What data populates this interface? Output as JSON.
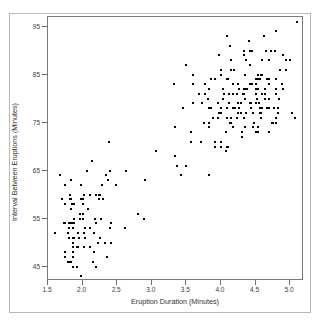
{
  "chart_data": {
    "type": "scatter",
    "title": "",
    "xlabel": "Eruption Duration (Minutes)",
    "ylabel": "Interval Between Eruptions (Minutes)",
    "xlim": [
      1.5,
      5.2
    ],
    "ylim": [
      42,
      97
    ],
    "xticks": [
      1.5,
      2.0,
      2.5,
      3.0,
      3.5,
      4.0,
      4.5,
      5.0
    ],
    "xticklabels": [
      "1.5",
      "2.0",
      "2.5",
      "3.0",
      "3.5",
      "4.0",
      "4.5",
      "5.0"
    ],
    "yticks": [
      95,
      85,
      75,
      65,
      55,
      45
    ],
    "yticklabels": [
      "95",
      "85",
      "75",
      "65",
      "55",
      "45"
    ],
    "grid": false,
    "legend": null,
    "marker": {
      "shape": "square",
      "size_px": 2,
      "color": "#000000"
    },
    "n_points": 272,
    "series": [
      {
        "name": "Old Faithful eruptions",
        "color": "#000000",
        "x": [
          3.6,
          1.8,
          3.333,
          2.283,
          4.533,
          2.883,
          4.7,
          3.6,
          1.95,
          4.35,
          1.833,
          3.917,
          4.2,
          1.75,
          4.7,
          2.167,
          1.75,
          4.8,
          1.6,
          4.25,
          1.8,
          1.75,
          3.45,
          3.067,
          4.533,
          3.6,
          1.967,
          4.083,
          3.85,
          4.433,
          4.3,
          4.467,
          3.367,
          4.033,
          3.833,
          2.017,
          1.867,
          4.833,
          1.833,
          4.783,
          4.35,
          1.883,
          4.567,
          1.75,
          4.533,
          3.317,
          3.833,
          2.1,
          4.633,
          2.0,
          4.8,
          4.716,
          1.833,
          4.833,
          1.733,
          4.883,
          3.717,
          1.667,
          4.567,
          4.317,
          2.233,
          4.5,
          1.75,
          4.8,
          1.817,
          4.4,
          4.167,
          4.7,
          2.067,
          4.7,
          4.033,
          1.967,
          4.5,
          4.0,
          1.983,
          5.067,
          2.017,
          4.567,
          3.883,
          3.6,
          4.133,
          4.333,
          4.1,
          2.633,
          4.067,
          4.933,
          3.95,
          4.517,
          2.167,
          4.0,
          2.2,
          4.333,
          1.867,
          4.817,
          1.833,
          4.3,
          4.667,
          3.75,
          1.867,
          4.9,
          2.483,
          4.367,
          2.1,
          4.5,
          4.05,
          1.867,
          4.7,
          1.783,
          4.85,
          3.683,
          4.733,
          2.3,
          4.9,
          4.417,
          1.7,
          4.633,
          2.317,
          4.6,
          1.817,
          4.417,
          2.617,
          4.067,
          4.25,
          1.967,
          4.6,
          3.767,
          1.917,
          4.5,
          2.267,
          4.65,
          1.867,
          4.167,
          2.8,
          4.333,
          1.833,
          4.383,
          1.883,
          4.933,
          2.033,
          3.733,
          4.233,
          2.233,
          4.533,
          4.817,
          4.333,
          1.983,
          4.633,
          2.017,
          5.1,
          1.8,
          5.033,
          4.0,
          2.4,
          4.6,
          3.567,
          4.0,
          4.5,
          4.083,
          1.8,
          3.967,
          2.2,
          4.15,
          2.0,
          3.833,
          3.5,
          4.583,
          2.367,
          5.0,
          1.933,
          4.617,
          1.917,
          2.083,
          4.583,
          3.333,
          4.167,
          4.333,
          4.5,
          2.417,
          4.0,
          4.167,
          1.883,
          4.583,
          4.25,
          3.767,
          2.033,
          4.433,
          4.083,
          1.833,
          4.417,
          2.183,
          4.8,
          1.833,
          4.8,
          4.1,
          3.966,
          4.233,
          3.5,
          4.366,
          2.25,
          4.667,
          2.1,
          4.35,
          4.133,
          1.867,
          4.6,
          1.783,
          4.367,
          3.85,
          1.933,
          4.5,
          2.383,
          4.7,
          1.867,
          3.833,
          3.417,
          4.233,
          2.4,
          4.8,
          2.0,
          4.15,
          1.867,
          4.267,
          1.75,
          4.483,
          4.0,
          4.117,
          4.083,
          4.267,
          3.917,
          4.55,
          4.083,
          2.417,
          4.183,
          2.217,
          4.45,
          1.883,
          1.85,
          4.283,
          3.95,
          2.333,
          4.15,
          2.35,
          4.933,
          2.9,
          4.583,
          3.833,
          2.083,
          4.367,
          2.133,
          4.35,
          2.2,
          4.45,
          3.567,
          4.5,
          4.15,
          3.817,
          3.917,
          4.45,
          2.0,
          4.283,
          4.767,
          4.533,
          1.85,
          4.25,
          1.983,
          2.25,
          4.75,
          4.117,
          2.15,
          4.417,
          1.817,
          4.467
        ],
        "y": [
          79,
          54,
          74,
          62,
          85,
          55,
          88,
          85,
          51,
          85,
          54,
          84,
          78,
          47,
          83,
          52,
          62,
          84,
          52,
          79,
          51,
          47,
          78,
          69,
          74,
          83,
          55,
          76,
          78,
          79,
          73,
          77,
          66,
          80,
          74,
          52,
          48,
          80,
          59,
          90,
          80,
          58,
          84,
          58,
          73,
          83,
          64,
          53,
          82,
          59,
          75,
          90,
          54,
          80,
          54,
          83,
          71,
          64,
          77,
          81,
          59,
          84,
          48,
          82,
          60,
          92,
          78,
          78,
          65,
          73,
          82,
          56,
          79,
          71,
          62,
          76,
          60,
          78,
          76,
          83,
          75,
          82,
          70,
          65,
          73,
          88,
          76,
          80,
          48,
          86,
          60,
          90,
          50,
          78,
          63,
          72,
          84,
          75,
          51,
          82,
          62,
          88,
          49,
          83,
          81,
          47,
          84,
          52,
          86,
          81,
          75,
          59,
          89,
          79,
          59,
          81,
          50,
          85,
          59,
          87,
          53,
          69,
          77,
          56,
          88,
          81,
          45,
          82,
          55,
          90,
          45,
          83,
          56,
          89,
          46,
          82,
          51,
          86,
          53,
          79,
          81,
          60,
          82,
          77,
          76,
          59,
          80,
          49,
          96,
          53,
          77,
          77,
          65,
          81,
          71,
          70,
          81,
          93,
          53,
          89,
          45,
          86,
          58,
          78,
          66,
          76,
          63,
          88,
          52,
          93,
          49,
          57,
          77,
          68,
          81,
          81,
          73,
          50,
          85,
          74,
          55,
          77,
          83,
          83,
          51,
          78,
          84,
          46,
          83,
          55,
          81,
          57,
          76,
          84,
          77,
          81,
          87,
          77,
          51,
          78,
          60,
          82,
          91,
          53,
          78,
          46,
          77,
          84,
          49,
          83,
          71,
          80,
          49,
          75,
          64,
          76,
          53,
          94,
          55,
          76,
          50,
          82,
          54,
          75,
          78,
          79,
          78,
          78,
          70,
          79,
          70,
          54,
          86,
          50,
          90,
          54,
          54,
          77,
          79,
          64,
          75,
          47,
          86,
          63,
          85,
          82,
          57,
          82,
          67,
          74,
          54,
          83,
          73,
          73,
          88,
          80,
          71,
          83,
          56,
          79,
          78,
          84,
          58,
          83,
          43,
          60,
          75,
          81,
          46,
          90,
          46,
          74
        ]
      }
    ]
  },
  "axes": {
    "y_title": "Interval Between Eruptions (Minutes)",
    "x_title": "Eruption Duration (Minutes)"
  }
}
